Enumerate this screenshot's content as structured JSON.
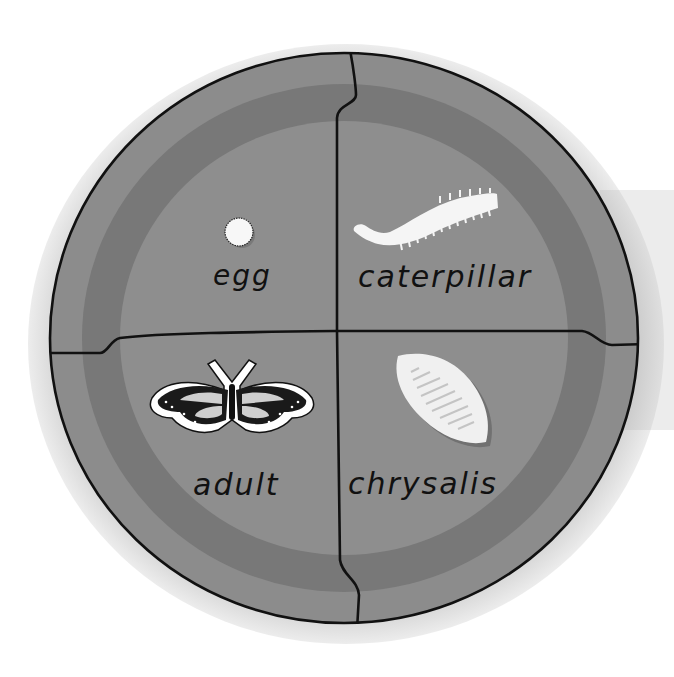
{
  "diagram": {
    "type": "life-cycle-wheel",
    "colors": {
      "outer_ring": "#8c8c8c",
      "middle_band": "#7a7a7a",
      "inner_fill": "#8e8e8e",
      "outline": "#111111",
      "figure_fill": "#f4f4f4",
      "side_panel": "#ececec"
    },
    "stages": [
      {
        "position": "top-left",
        "label": "egg",
        "icon": "egg-icon"
      },
      {
        "position": "top-right",
        "label": "caterpillar",
        "icon": "caterpillar-icon"
      },
      {
        "position": "bottom-right",
        "label": "chrysalis",
        "icon": "chrysalis-icon"
      },
      {
        "position": "bottom-left",
        "label": "adult",
        "icon": "butterfly-icon"
      }
    ]
  }
}
